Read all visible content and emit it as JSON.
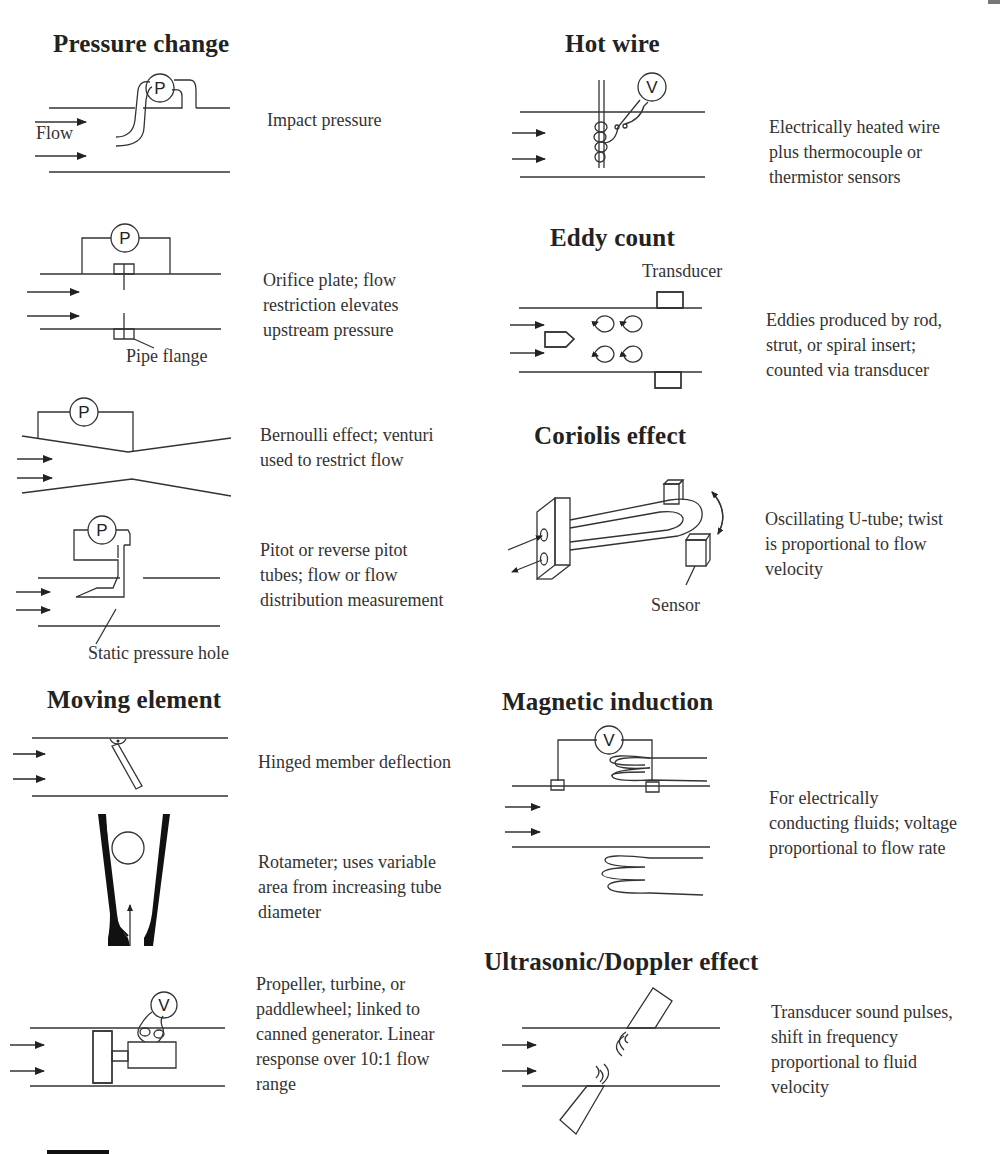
{
  "page": {
    "sections": {
      "pressure_change": {
        "title": "Pressure change",
        "items": [
          {
            "description": "Impact pressure",
            "gauge": "P",
            "labels": {
              "flow": "Flow"
            }
          },
          {
            "description": "Orifice plate; flow\nrestriction elevates\nupstream pressure",
            "gauge": "P",
            "labels": {
              "flange": "Pipe flange"
            }
          },
          {
            "description": "Bernoulli effect; venturi\nused to restrict flow",
            "gauge": "P"
          },
          {
            "description": "Pitot or reverse pitot\ntubes; flow or flow\ndistribution measurement",
            "gauge": "P",
            "labels": {
              "hole": "Static pressure hole"
            }
          }
        ]
      },
      "moving_element": {
        "title": "Moving element",
        "items": [
          {
            "description": "Hinged member deflection"
          },
          {
            "description": "Rotameter; uses variable\narea from increasing tube\ndiameter"
          },
          {
            "description": "Propeller, turbine, or\npaddlewheel; linked to\ncanned generator. Linear\nresponse over 10:1 flow\nrange",
            "gauge": "V"
          }
        ]
      },
      "hot_wire": {
        "title": "Hot wire",
        "description": "Electrically heated wire\nplus thermocouple or\nthermistor sensors",
        "gauge": "V"
      },
      "eddy_count": {
        "title": "Eddy count",
        "description": "Eddies produced by rod,\nstrut, or spiral insert;\ncounted via transducer",
        "labels": {
          "transducer": "Transducer"
        }
      },
      "coriolis": {
        "title": "Coriolis effect",
        "description": "Oscillating U-tube; twist\nis proportional to flow\nvelocity",
        "labels": {
          "sensor": "Sensor"
        }
      },
      "magnetic_induction": {
        "title": "Magnetic induction",
        "description": "For electrically\nconducting fluids; voltage\nproportional to flow rate",
        "gauge": "V"
      },
      "ultrasonic": {
        "title": "Ultrasonic/Doppler effect",
        "description": "Transducer sound pulses,\nshift in frequency\nproportional to fluid\nvelocity"
      }
    }
  }
}
